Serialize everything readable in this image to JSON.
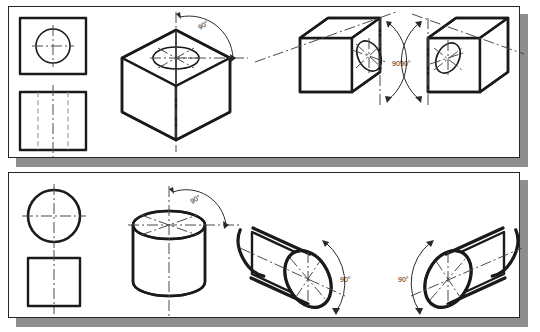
{
  "figure": {
    "background_color": "#ffffff",
    "ink_color": "#1a1a1a",
    "shadow_color": "#8e8e8e"
  },
  "panels": [
    {
      "id": "panel-top",
      "name": "cube-with-hole-panel",
      "subject": "cube",
      "orthographic_views": [
        {
          "name": "top-view",
          "shape": "square-with-circle",
          "has_center_lines": true
        },
        {
          "name": "front-view",
          "shape": "square-with-hidden-lines",
          "has_center_lines": true,
          "hidden_line_count": 2
        }
      ],
      "isometric_views": [
        {
          "name": "cube-hole-top-face",
          "hole_face": "top",
          "angle_label": "90°",
          "arc_side": "right"
        },
        {
          "name": "cube-hole-right-face",
          "hole_face": "right",
          "angle_label": "90°",
          "arc_side": "right"
        },
        {
          "name": "cube-hole-left-face",
          "hole_face": "left",
          "angle_label": "90°",
          "arc_side": "left"
        }
      ]
    },
    {
      "id": "panel-bottom",
      "name": "cylinder-panel",
      "subject": "cylinder",
      "orthographic_views": [
        {
          "name": "top-view",
          "shape": "circle",
          "has_center_lines": true
        },
        {
          "name": "front-view",
          "shape": "square",
          "has_center_lines": true
        }
      ],
      "isometric_views": [
        {
          "name": "cylinder-axis-vertical",
          "axis": "vertical",
          "angle_label": "90°",
          "arc_side": "right"
        },
        {
          "name": "cylinder-axis-right-tilt",
          "axis": "tilted-right",
          "angle_label": "90°",
          "arc_side": "right"
        },
        {
          "name": "cylinder-axis-left-tilt",
          "axis": "tilted-left",
          "angle_label": "90°",
          "arc_side": "left"
        }
      ]
    }
  ],
  "labels": {
    "angle_90": "90°"
  }
}
